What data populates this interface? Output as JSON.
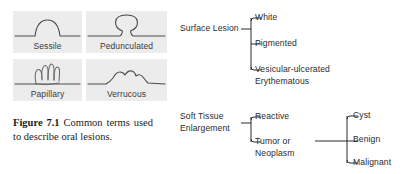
{
  "figure": {
    "shapes": [
      {
        "name": "sessile",
        "label": "Sessile"
      },
      {
        "name": "pedunculated",
        "label": "Pedunculated"
      },
      {
        "name": "papillary",
        "label": "Papillary"
      },
      {
        "name": "verrucous",
        "label": "Verrucous"
      }
    ],
    "caption": {
      "strong": "Figure 7.1",
      "text": "  Common terms used to describe oral lesions."
    }
  },
  "tree": {
    "roots": [
      {
        "name": "surface-lesion",
        "label": "Surface Lesion"
      },
      {
        "name": "soft-tissue-enlargement",
        "label": "Soft Tissue\nEnlargement"
      }
    ],
    "surface_children": [
      {
        "name": "white",
        "label": "White"
      },
      {
        "name": "pigmented",
        "label": "Pigmented"
      },
      {
        "name": "vesicular",
        "label": "Vesicular-ulcerated\nErythematous"
      }
    ],
    "soft_children": [
      {
        "name": "reactive",
        "label": "Reactive"
      },
      {
        "name": "tumor",
        "label": "Tumor or\nNeoplasm"
      }
    ],
    "tumor_children": [
      {
        "name": "cyst",
        "label": "Cyst"
      },
      {
        "name": "benign",
        "label": "Benign"
      },
      {
        "name": "malignant",
        "label": "Malignant"
      }
    ]
  },
  "colors": {
    "panel_background": "#ececed",
    "ink": "#2b2b2d",
    "page_background": "#ffffff"
  }
}
